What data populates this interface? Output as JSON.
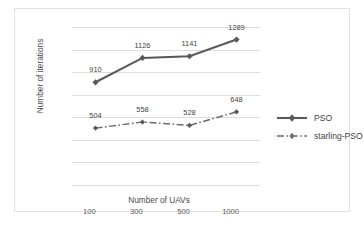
{
  "chart_data": {
    "type": "line",
    "title": "",
    "xlabel": "Number of UAVs",
    "ylabel": "Number of iterations",
    "categories": [
      "100",
      "300",
      "500",
      "1000"
    ],
    "series": [
      {
        "name": "PSO",
        "values": [
          910,
          1126,
          1141,
          1289
        ],
        "color": "#595959",
        "linestyle": "solid",
        "marker": "diamond"
      },
      {
        "name": "starling-PSO",
        "values": [
          504,
          558,
          528,
          648
        ],
        "color": "#595959",
        "linestyle": "dashdot",
        "marker": "diamond"
      }
    ],
    "yticks": [
      "0",
      "200",
      "400",
      "600",
      "800",
      "1000",
      "1200",
      "1400"
    ],
    "ylim": [
      0,
      1400
    ],
    "grid": "horizontal",
    "legend_position": "right",
    "data_labels": {
      "PSO": [
        "910",
        "1126",
        "1141",
        "1289"
      ],
      "starling-PSO": [
        "504",
        "558",
        "528",
        "648"
      ]
    }
  },
  "legend": {
    "items": [
      {
        "label": "PSO"
      },
      {
        "label": "starling-PSO"
      }
    ]
  }
}
